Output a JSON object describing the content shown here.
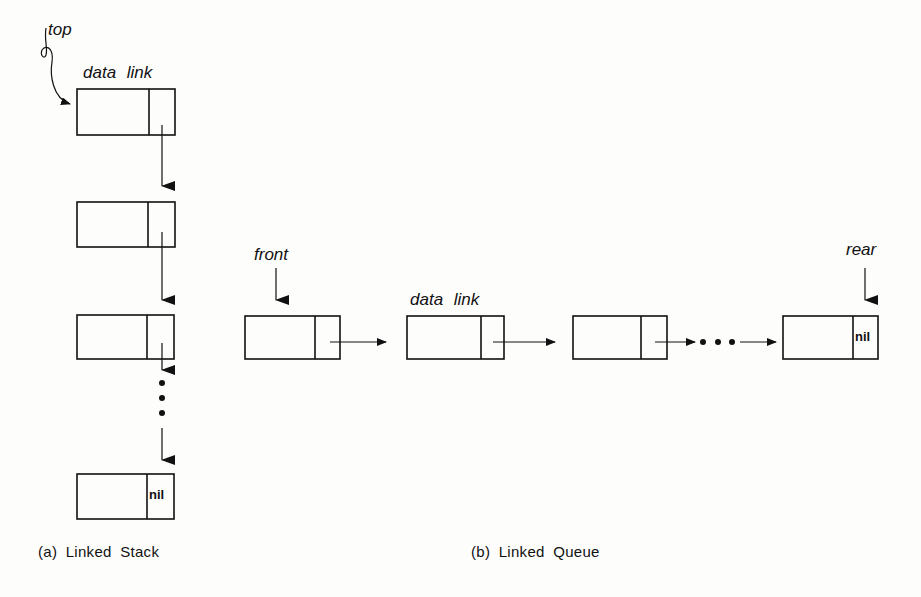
{
  "diagram": {
    "stack": {
      "caption": "(a) Linked Stack",
      "pointer_label": "top",
      "field_labels": "data link",
      "nodes": [
        {
          "data": "",
          "link": "→"
        },
        {
          "data": "",
          "link": "→"
        },
        {
          "data": "",
          "link": "→ ..."
        },
        {
          "data": "",
          "link": "nil"
        }
      ],
      "terminal_value": "nil"
    },
    "queue": {
      "caption": "(b) Linked Queue",
      "front_label": "front",
      "rear_label": "rear",
      "field_labels": "data link",
      "nodes": [
        {
          "data": "",
          "link": "→"
        },
        {
          "data": "",
          "link": "→"
        },
        {
          "data": "",
          "link": "→ ..."
        },
        {
          "data": "",
          "link": "nil"
        }
      ],
      "terminal_value": "nil"
    },
    "ellipsis": "• • •"
  }
}
